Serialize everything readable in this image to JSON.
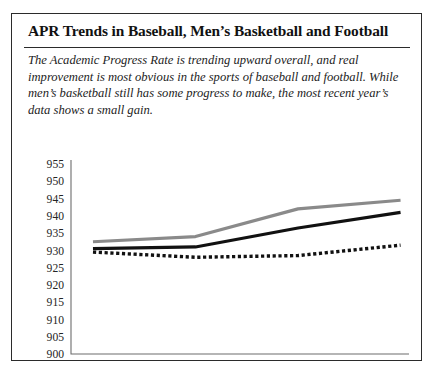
{
  "figure": {
    "title": "APR Trends in Baseball, Men’s Basketball and Football",
    "caption": "The Academic Progress Rate is trending upward overall, and real improvement is most obvious in the sports of baseball and football. While men’s basketball still has some progress to make, the most recent year’s data shows a small gain."
  },
  "chart_data": {
    "type": "line",
    "title": "APR Trends in Baseball, Men’s Basketball and Football",
    "xlabel": "",
    "ylabel": "",
    "categories": [
      "Year 1",
      "Year 2",
      "Year 3",
      "Year 4"
    ],
    "ylim": [
      900,
      955
    ],
    "yticks": [
      900,
      905,
      910,
      915,
      920,
      925,
      930,
      935,
      940,
      945,
      950,
      955
    ],
    "grid": false,
    "legend": "none",
    "series": [
      {
        "name": "Football",
        "style": "solid",
        "color": "#8a8a8a",
        "values": [
          932.5,
          934,
          942,
          944.5
        ]
      },
      {
        "name": "Baseball",
        "style": "solid",
        "color": "#111111",
        "values": [
          930.5,
          931,
          936.5,
          941
        ]
      },
      {
        "name": "Men’s Basketball",
        "style": "dotted",
        "color": "#111111",
        "values": [
          929.5,
          928,
          928.5,
          931.5
        ]
      }
    ]
  }
}
